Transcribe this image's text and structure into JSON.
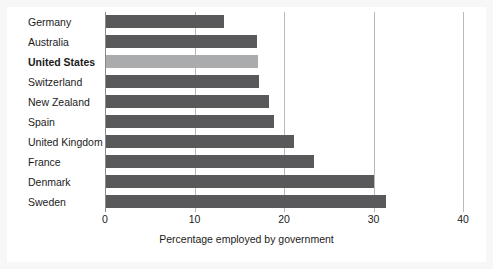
{
  "chart_data": {
    "type": "bar",
    "orientation": "horizontal",
    "title": "",
    "xlabel": "Percentage employed by government",
    "ylabel": "",
    "xlim": [
      0,
      40
    ],
    "xticks": [
      "0",
      "10",
      "20",
      "30",
      "40"
    ],
    "xtick_values": [
      0,
      10,
      20,
      30,
      40
    ],
    "grid": "vertical gridlines at 10, 20, 30, 40",
    "legend": "none",
    "categories": [
      "Germany",
      "Australia",
      "United States",
      "Switzerland",
      "New Zealand",
      "Spain",
      "United Kingdom",
      "France",
      "Denmark",
      "Sweden"
    ],
    "values": [
      13.2,
      16.9,
      17.0,
      17.1,
      18.2,
      18.8,
      21.0,
      23.2,
      29.9,
      31.3
    ],
    "highlighted_category": "United States",
    "colors": {
      "bar": "#59595b",
      "bar_highlight": "#aaabad",
      "gridline": "#b9b9b9",
      "axis": "#8a8a8a",
      "text": "#1b1b1b",
      "background": "#ffffff",
      "frame": "#f7f7f7"
    },
    "bars": [
      {
        "label": "Germany",
        "value": 13.2,
        "highlight": false
      },
      {
        "label": "Australia",
        "value": 16.9,
        "highlight": false
      },
      {
        "label": "United States",
        "value": 17.0,
        "highlight": true
      },
      {
        "label": "Switzerland",
        "value": 17.1,
        "highlight": false
      },
      {
        "label": "New Zealand",
        "value": 18.2,
        "highlight": false
      },
      {
        "label": "Spain",
        "value": 18.8,
        "highlight": false
      },
      {
        "label": "United Kingdom",
        "value": 21.0,
        "highlight": false
      },
      {
        "label": "France",
        "value": 23.2,
        "highlight": false
      },
      {
        "label": "Denmark",
        "value": 29.9,
        "highlight": false
      },
      {
        "label": "Sweden",
        "value": 31.3,
        "highlight": false
      }
    ]
  }
}
